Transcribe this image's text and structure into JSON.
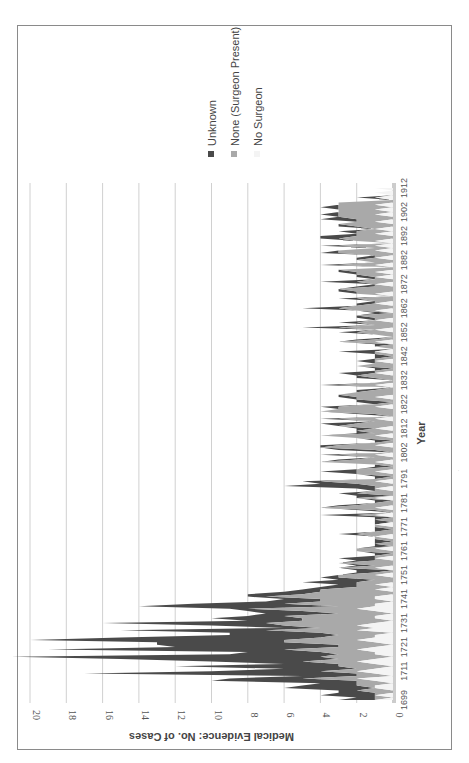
{
  "chart_data": {
    "type": "area",
    "stacked": true,
    "orientation": "rotated-90-clockwise",
    "title": "",
    "xlabel": "Year",
    "ylabel": "Medical Evidence: No. of Cases",
    "ylim": [
      0,
      20
    ],
    "yticks": [
      0,
      2,
      4,
      6,
      8,
      10,
      12,
      14,
      16,
      18,
      20
    ],
    "xtick_labels": [
      "1699",
      "1711",
      "1721",
      "1731",
      "1741",
      "1751",
      "1761",
      "1771",
      "1781",
      "1791",
      "1802",
      "1812",
      "1822",
      "1832",
      "1842",
      "1852",
      "1862",
      "1872",
      "1882",
      "1892",
      "1902",
      "1912"
    ],
    "grid": true,
    "legend_position": "right",
    "legend": [
      "Unknown",
      "None (Surgeon Present)",
      "No Surgeon"
    ],
    "colors": {
      "Unknown": "#4a4a4a",
      "None (Surgeon Present)": "#a9a9a9",
      "No Surgeon": "#f4f4f4"
    },
    "x": {
      "start": 1699,
      "end": 1912
    },
    "series": [
      {
        "name": "No Surgeon",
        "values": [
          1,
          0,
          1,
          0,
          0,
          1,
          1,
          0,
          1,
          2,
          0,
          1,
          2,
          1,
          0,
          1,
          2,
          1,
          0,
          1,
          1,
          2,
          1,
          0,
          1,
          2,
          1,
          1,
          0,
          2,
          1,
          2,
          1,
          0,
          1,
          1,
          0,
          1,
          2,
          1,
          1,
          0,
          1,
          1,
          0,
          0,
          1,
          0,
          1,
          0,
          0,
          0,
          1,
          0,
          0,
          1,
          0,
          0,
          0,
          1,
          0,
          0,
          0,
          1,
          0,
          0,
          0,
          0,
          1,
          0,
          0,
          0,
          0,
          1,
          0,
          0,
          0,
          1,
          0,
          0,
          1,
          0,
          0,
          0,
          1,
          0,
          0,
          0,
          1,
          0,
          0,
          1,
          0,
          0,
          0,
          1,
          0,
          0,
          0,
          1,
          0,
          0,
          1,
          0,
          0,
          0,
          1,
          0,
          0,
          0,
          1,
          0,
          0,
          1,
          0,
          0,
          0,
          1,
          0,
          0,
          0,
          0,
          1,
          0,
          0,
          0,
          1,
          0,
          0,
          0,
          0,
          1,
          0,
          0,
          0,
          0,
          1,
          0,
          0,
          0,
          0,
          1,
          0,
          0,
          0,
          1,
          0,
          0,
          0,
          1,
          0,
          0,
          0,
          0,
          1,
          0,
          0,
          0,
          1,
          0,
          0,
          0,
          1,
          0,
          0,
          1,
          0,
          0,
          0,
          1,
          0,
          0,
          0,
          1,
          0,
          0,
          1,
          0,
          1,
          0,
          0,
          1,
          0,
          0,
          1,
          0,
          0,
          1,
          0,
          1,
          0,
          1,
          0,
          0,
          1,
          0,
          1,
          0,
          0,
          1,
          0,
          0,
          1,
          0,
          1,
          0,
          1,
          0,
          0,
          1,
          0,
          1,
          0,
          1
        ]
      },
      {
        "name": "None (Surgeon Present)",
        "values": [
          0,
          1,
          0,
          1,
          2,
          0,
          1,
          2,
          1,
          3,
          2,
          1,
          2,
          1,
          3,
          2,
          3,
          2,
          4,
          2,
          3,
          4,
          2,
          3,
          5,
          4,
          3,
          2,
          4,
          5,
          3,
          4,
          6,
          5,
          4,
          5,
          3,
          4,
          6,
          2,
          5,
          4,
          3,
          6,
          5,
          4,
          3,
          2,
          1,
          2,
          1,
          3,
          2,
          1,
          0,
          2,
          1,
          3,
          1,
          0,
          1,
          0,
          2,
          1,
          0,
          1,
          0,
          1,
          0,
          2,
          1,
          0,
          1,
          0,
          0,
          1,
          0,
          1,
          0,
          1,
          3,
          2,
          1,
          0,
          1,
          0,
          2,
          1,
          0,
          1,
          2,
          3,
          1,
          0,
          2,
          1,
          2,
          0,
          1,
          3,
          2,
          1,
          2,
          0,
          1,
          4,
          2,
          1,
          0,
          2,
          3,
          1,
          2,
          0,
          3,
          2,
          1,
          2,
          0,
          1,
          4,
          3,
          2,
          1,
          0,
          2,
          1,
          3,
          2,
          1,
          0,
          2,
          1,
          0,
          1,
          2,
          0,
          1,
          0,
          2,
          1,
          0,
          1,
          0,
          1,
          0,
          0,
          1,
          0,
          2,
          1,
          0,
          1,
          2,
          0,
          3,
          1,
          2,
          0,
          1,
          2,
          0,
          1,
          3,
          2,
          0,
          1,
          2,
          0,
          1,
          2,
          3,
          1,
          0,
          2,
          1,
          0,
          2,
          1,
          3,
          0,
          2,
          1,
          2,
          0,
          1,
          3,
          2,
          1,
          2,
          0,
          1,
          3,
          2,
          1,
          2,
          0,
          2,
          3,
          1,
          2,
          3,
          2,
          3,
          2,
          3,
          2,
          3
        ]
      },
      {
        "name": "Unknown",
        "values": [
          2,
          1,
          3,
          2,
          1,
          5,
          3,
          2,
          8,
          4,
          3,
          15,
          6,
          4,
          9,
          3,
          5,
          12,
          17,
          6,
          4,
          13,
          9,
          10,
          7,
          14,
          11,
          6,
          5,
          8,
          2,
          4,
          9,
          3,
          5,
          2,
          4,
          3,
          1,
          11,
          5,
          3,
          2,
          1,
          3,
          2,
          1,
          2,
          1,
          3,
          2,
          1,
          0,
          1,
          2,
          0,
          1,
          0,
          1,
          2,
          0,
          1,
          0,
          0,
          1,
          0,
          1,
          0,
          0,
          1,
          0,
          1,
          0,
          0,
          1,
          0,
          1,
          2,
          0,
          1,
          0,
          1,
          0,
          1,
          0,
          2,
          1,
          0,
          1,
          5,
          2,
          1,
          0,
          1,
          0,
          2,
          0,
          1,
          0,
          0,
          1,
          0,
          1,
          0,
          2,
          0,
          1,
          0,
          1,
          0,
          0,
          1,
          0,
          1,
          0,
          2,
          0,
          1,
          0,
          1,
          0,
          0,
          1,
          0,
          2,
          0,
          1,
          0,
          0,
          1,
          0,
          1,
          0,
          0,
          1,
          0,
          2,
          0,
          1,
          0,
          0,
          1,
          0,
          1,
          0,
          2,
          0,
          0,
          1,
          0,
          1,
          0,
          0,
          1,
          0,
          2,
          0,
          1,
          0,
          1,
          0,
          1,
          0,
          2,
          0,
          1,
          0,
          1,
          0,
          0,
          1,
          0,
          1,
          0,
          2,
          0,
          1,
          0,
          1,
          0,
          0,
          1,
          0,
          0,
          1,
          0,
          1,
          0,
          0,
          1,
          0,
          0,
          1,
          2,
          0,
          1,
          0,
          1,
          0,
          0,
          2,
          0,
          1,
          0,
          0,
          1,
          0,
          0,
          0,
          1,
          0,
          0,
          0
        ]
      }
    ]
  },
  "legend": {
    "items": [
      {
        "label": "Unknown",
        "color": "#4a4a4a"
      },
      {
        "label": "None (Surgeon Present)",
        "color": "#a9a9a9"
      },
      {
        "label": "No Surgeon",
        "color": "#f4f4f4"
      }
    ]
  },
  "axes": {
    "x_title": "Year",
    "y_title": "Medical Evidence: No. of Cases"
  }
}
